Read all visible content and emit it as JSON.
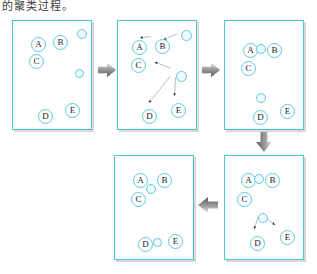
{
  "caption": {
    "text": "的聚类过程。"
  },
  "colors": {
    "panel_border": "#4cc3e0",
    "node_stroke": "#5cc8e4",
    "empty_fill": "#eefbfe",
    "flow_arrow": "#8f8f8f",
    "motion_arrow": "#111111",
    "shadow": "#d8d8d8",
    "background": "#ffffff",
    "label_text": "#1a1a1a"
  },
  "diagram": {
    "type": "clustering-step-sequence",
    "node_labels": [
      "A",
      "B",
      "C",
      "D",
      "E"
    ],
    "empty_node_count": 2,
    "step_count": 5
  },
  "panels": [
    {
      "id": "panel-1",
      "index": 1,
      "rect": {
        "x": 12,
        "y": 20,
        "w": 80,
        "h": 110
      },
      "nodes": [
        {
          "name": "node-a",
          "label": "A",
          "type": "lettered",
          "x": 18,
          "y": 16,
          "r": 7.5
        },
        {
          "name": "node-b",
          "label": "B",
          "type": "lettered",
          "x": 40,
          "y": 14,
          "r": 7.5
        },
        {
          "name": "node-c",
          "label": "C",
          "type": "lettered",
          "x": 16,
          "y": 33,
          "r": 7.5
        },
        {
          "name": "node-d",
          "label": "D",
          "type": "lettered",
          "x": 25,
          "y": 88,
          "r": 7.5
        },
        {
          "name": "node-e",
          "label": "E",
          "type": "lettered",
          "x": 52,
          "y": 82,
          "r": 7.5
        },
        {
          "name": "node-centroid-1",
          "label": "",
          "type": "empty",
          "x": 64,
          "y": 8,
          "r": 5
        },
        {
          "name": "node-centroid-2",
          "label": "",
          "type": "empty",
          "x": 62,
          "y": 48,
          "r": 4.5
        }
      ],
      "motion_arrows": []
    },
    {
      "id": "panel-2",
      "index": 2,
      "rect": {
        "x": 117,
        "y": 20,
        "w": 80,
        "h": 110
      },
      "nodes": [
        {
          "name": "node-a",
          "label": "A",
          "type": "lettered",
          "x": 14,
          "y": 19,
          "r": 7.5
        },
        {
          "name": "node-b",
          "label": "B",
          "type": "lettered",
          "x": 37,
          "y": 18,
          "r": 7.5
        },
        {
          "name": "node-c",
          "label": "C",
          "type": "lettered",
          "x": 13,
          "y": 37,
          "r": 7.5
        },
        {
          "name": "node-d",
          "label": "D",
          "type": "lettered",
          "x": 24,
          "y": 88,
          "r": 7.5
        },
        {
          "name": "node-e",
          "label": "E",
          "type": "lettered",
          "x": 53,
          "y": 82,
          "r": 7.5
        },
        {
          "name": "node-centroid-1",
          "label": "",
          "type": "empty",
          "x": 63,
          "y": 9,
          "r": 5.5
        },
        {
          "name": "node-centroid-2",
          "label": "",
          "type": "empty",
          "x": 58,
          "y": 50,
          "r": 5.5
        }
      ],
      "motion_arrows": [
        {
          "name": "arrow-centroid1-to-b",
          "x1": 61,
          "y1": 13,
          "x2": 47,
          "y2": 19
        },
        {
          "name": "arrow-b-to-a",
          "x1": 34,
          "y1": 16,
          "x2": 23,
          "y2": 17
        },
        {
          "name": "arrow-centroid2-to-c",
          "x1": 54,
          "y1": 48,
          "x2": 38,
          "y2": 42
        },
        {
          "name": "arrow-centroid2-to-d",
          "x1": 54,
          "y1": 56,
          "x2": 32,
          "y2": 83
        },
        {
          "name": "arrow-centroid2-to-e",
          "x1": 59,
          "y1": 57,
          "x2": 58,
          "y2": 76
        }
      ]
    },
    {
      "id": "panel-3",
      "index": 3,
      "rect": {
        "x": 224,
        "y": 20,
        "w": 80,
        "h": 110
      },
      "nodes": [
        {
          "name": "node-a",
          "label": "A",
          "type": "lettered",
          "x": 18,
          "y": 22,
          "r": 7.5
        },
        {
          "name": "node-b",
          "label": "B",
          "type": "lettered",
          "x": 42,
          "y": 22,
          "r": 7.5
        },
        {
          "name": "node-c",
          "label": "C",
          "type": "lettered",
          "x": 16,
          "y": 40,
          "r": 7.5
        },
        {
          "name": "node-d",
          "label": "D",
          "type": "lettered",
          "x": 28,
          "y": 89,
          "r": 7.5
        },
        {
          "name": "node-e",
          "label": "E",
          "type": "lettered",
          "x": 55,
          "y": 83,
          "r": 7.5
        },
        {
          "name": "node-centroid-1",
          "label": "",
          "type": "empty",
          "x": 31,
          "y": 23,
          "r": 5
        },
        {
          "name": "node-centroid-2",
          "label": "",
          "type": "empty",
          "x": 31,
          "y": 72,
          "r": 5
        }
      ],
      "motion_arrows": []
    },
    {
      "id": "panel-4",
      "index": 4,
      "rect": {
        "x": 224,
        "y": 155,
        "w": 80,
        "h": 105
      },
      "nodes": [
        {
          "name": "node-a",
          "label": "A",
          "type": "lettered",
          "x": 16,
          "y": 17,
          "r": 7.5
        },
        {
          "name": "node-b",
          "label": "B",
          "type": "lettered",
          "x": 40,
          "y": 17,
          "r": 7.5
        },
        {
          "name": "node-c",
          "label": "C",
          "type": "lettered",
          "x": 12,
          "y": 36,
          "r": 7.5
        },
        {
          "name": "node-d",
          "label": "D",
          "type": "lettered",
          "x": 25,
          "y": 80,
          "r": 7.5
        },
        {
          "name": "node-e",
          "label": "E",
          "type": "lettered",
          "x": 55,
          "y": 74,
          "r": 7.5
        },
        {
          "name": "node-centroid-1",
          "label": "",
          "type": "empty",
          "x": 29,
          "y": 18,
          "r": 5
        },
        {
          "name": "node-centroid-2",
          "label": "",
          "type": "empty",
          "x": 33,
          "y": 57,
          "r": 5
        }
      ],
      "motion_arrows": [
        {
          "name": "arrow-c-to-centroid1",
          "x1": 22,
          "y1": 33,
          "x2": 29,
          "y2": 26
        },
        {
          "name": "arrow-centroid2-to-d",
          "x1": 34,
          "y1": 62,
          "x2": 30,
          "y2": 74
        },
        {
          "name": "arrow-centroid2-to-e",
          "x1": 38,
          "y1": 60,
          "x2": 51,
          "y2": 70
        }
      ]
    },
    {
      "id": "panel-5",
      "index": 5,
      "rect": {
        "x": 114,
        "y": 155,
        "w": 80,
        "h": 105
      },
      "nodes": [
        {
          "name": "node-a",
          "label": "A",
          "type": "lettered",
          "x": 18,
          "y": 17,
          "r": 7.5
        },
        {
          "name": "node-b",
          "label": "B",
          "type": "lettered",
          "x": 42,
          "y": 17,
          "r": 7.5
        },
        {
          "name": "node-c",
          "label": "C",
          "type": "lettered",
          "x": 16,
          "y": 36,
          "r": 7.5
        },
        {
          "name": "node-d",
          "label": "D",
          "type": "lettered",
          "x": 23,
          "y": 81,
          "r": 7.5
        },
        {
          "name": "node-e",
          "label": "E",
          "type": "lettered",
          "x": 53,
          "y": 78,
          "r": 7.5
        },
        {
          "name": "node-centroid-1",
          "label": "",
          "type": "empty",
          "x": 31,
          "y": 28,
          "r": 5
        },
        {
          "name": "node-centroid-2",
          "label": "",
          "type": "empty",
          "x": 38,
          "y": 82,
          "r": 4.5
        }
      ],
      "motion_arrows": []
    }
  ],
  "flow_arrows": [
    {
      "name": "flow-arrow-1-to-2",
      "direction": "right",
      "x": 96,
      "y": 58,
      "w": 22,
      "h": 24
    },
    {
      "name": "flow-arrow-2-to-3",
      "direction": "right",
      "x": 200,
      "y": 58,
      "w": 22,
      "h": 24
    },
    {
      "name": "flow-arrow-3-to-4",
      "direction": "down",
      "x": 252,
      "y": 130,
      "w": 24,
      "h": 24
    },
    {
      "name": "flow-arrow-4-to-5",
      "direction": "left",
      "x": 196,
      "y": 193,
      "w": 24,
      "h": 24
    }
  ]
}
